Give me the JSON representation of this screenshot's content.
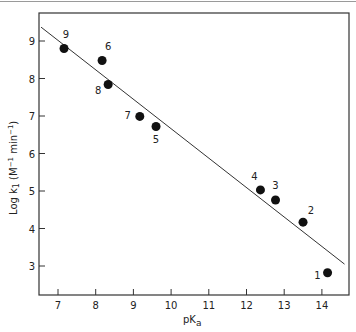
{
  "chart_data": {
    "type": "scatter",
    "title": "",
    "xlabel": "pKa",
    "ylabel": "Log k1 (M^-1 min^-1)",
    "xlim": [
      6.5,
      14.8
    ],
    "ylim": [
      2.2,
      9.7
    ],
    "xticks": [
      7,
      8,
      9,
      10,
      11,
      12,
      13,
      14
    ],
    "yticks": [
      3,
      4,
      5,
      6,
      7,
      8,
      9
    ],
    "grid": false,
    "legend": null,
    "points": [
      {
        "label": "1",
        "x": 14.15,
        "y": 2.82
      },
      {
        "label": "2",
        "x": 13.5,
        "y": 4.17
      },
      {
        "label": "3",
        "x": 12.77,
        "y": 4.76
      },
      {
        "label": "4",
        "x": 12.37,
        "y": 5.03
      },
      {
        "label": "5",
        "x": 9.6,
        "y": 6.72
      },
      {
        "label": "6",
        "x": 8.17,
        "y": 8.48
      },
      {
        "label": "7",
        "x": 9.17,
        "y": 6.99
      },
      {
        "label": "8",
        "x": 8.33,
        "y": 7.84
      },
      {
        "label": "9",
        "x": 7.16,
        "y": 8.8
      }
    ],
    "fit_line": {
      "x": [
        6.55,
        14.6
      ],
      "y": [
        9.37,
        3.05
      ]
    }
  },
  "axes": {
    "x_label_main": "pK",
    "x_label_sub": "a",
    "y_label_main": "Log k",
    "y_label_sub": "1",
    "y_label_units": "(M",
    "y_label_exp1": "−1",
    "y_label_min": " min",
    "y_label_exp2": "−1",
    "y_label_close": ")"
  }
}
